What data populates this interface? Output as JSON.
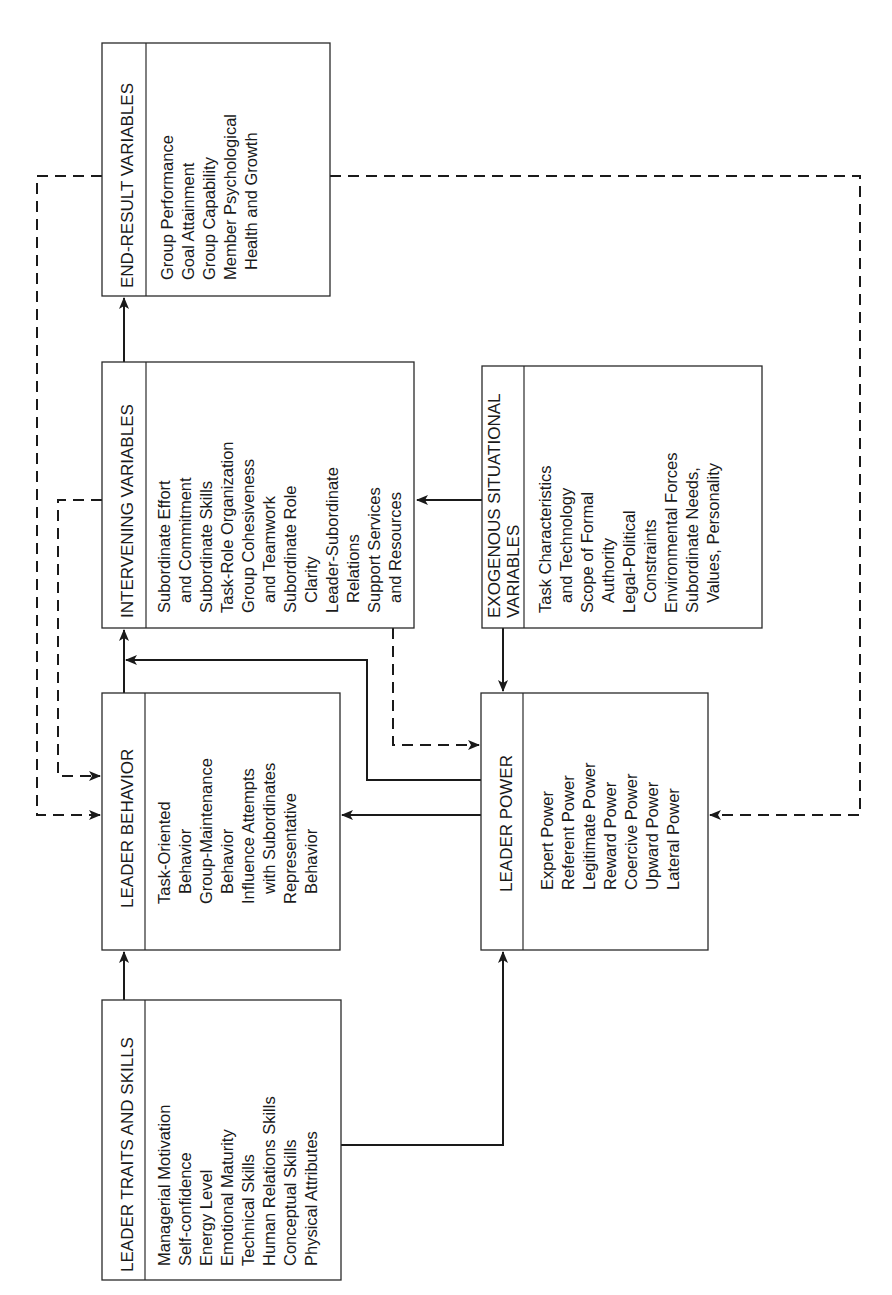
{
  "diagram": {
    "type": "flow-diagram",
    "orientation": "rotated-90-ccw",
    "colors": {
      "line": "#1a1a1a",
      "box_border": "#2a2a2a",
      "background": "#ffffff"
    },
    "boxes": {
      "end_result": {
        "title": "END-RESULT VARIABLES",
        "items": [
          "Group Performance",
          "Goal Attainment",
          "Group Capability",
          "Member Psychological",
          "  Health and Growth"
        ]
      },
      "intervening": {
        "title": "INTERVENING VARIABLES",
        "items": [
          "Subordinate Effort",
          "  and Commitment",
          "Subordinate Skills",
          "Task-Role Organization",
          "Group Cohesiveness",
          "  and Teamwork",
          "Subordinate Role",
          "  Clarity",
          "Leader-Subordinate",
          "  Relations",
          "Support Services",
          "  and Resources"
        ]
      },
      "exogenous": {
        "title_line1": "EXOGENOUS SITUATIONAL",
        "title_line2": "VARIABLES",
        "items": [
          "Task Characteristics",
          "  and Technology",
          "Scope of Formal",
          "  Authority",
          "Legal-Political",
          "  Constraints",
          "Environmental Forces",
          "Subordinate Needs,",
          "  Values, Personality"
        ]
      },
      "leader_behavior": {
        "title": "LEADER BEHAVIOR",
        "items": [
          "Task-Oriented",
          "  Behavior",
          "Group-Maintenance",
          "  Behavior",
          "Influence Attempts",
          "  with Subordinates",
          "Representative",
          "  Behavior"
        ]
      },
      "leader_power": {
        "title": "LEADER POWER",
        "items": [
          "Expert Power",
          "Referent Power",
          "Legitimate Power",
          "Reward Power",
          "Coercive Power",
          "Upward Power",
          "Lateral Power"
        ]
      },
      "leader_traits": {
        "title": "LEADER TRAITS AND SKILLS",
        "items": [
          "Managerial Motivation",
          "Self-confidence",
          "Energy Level",
          "Emotional Maturity",
          "Technical Skills",
          "Human Relations Skills",
          "Conceptual Skills",
          "Physical Attributes"
        ]
      }
    },
    "connections": [
      {
        "from": "leader_traits",
        "to": "leader_behavior",
        "style": "solid"
      },
      {
        "from": "leader_traits",
        "to": "leader_power",
        "style": "solid"
      },
      {
        "from": "leader_behavior",
        "to": "intervening",
        "style": "solid"
      },
      {
        "from": "intervening",
        "to": "end_result",
        "style": "solid"
      },
      {
        "from": "exogenous",
        "to": "intervening",
        "style": "solid"
      },
      {
        "from": "exogenous",
        "to": "leader_power",
        "style": "solid"
      },
      {
        "from": "leader_power",
        "to": "leader_behavior",
        "style": "solid"
      },
      {
        "from": "leader_power",
        "to": "intervening",
        "style": "solid"
      },
      {
        "from": "intervening",
        "to": "leader_behavior",
        "style": "dashed"
      },
      {
        "from": "intervening",
        "to": "leader_power",
        "style": "dashed"
      },
      {
        "from": "end_result",
        "to": "leader_behavior",
        "style": "dashed"
      },
      {
        "from": "end_result",
        "to": "leader_power",
        "style": "dashed"
      }
    ]
  }
}
